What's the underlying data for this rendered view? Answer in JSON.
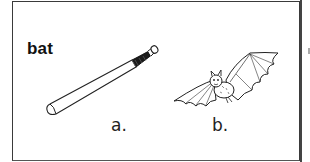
{
  "card": {
    "word": "bat",
    "choices": [
      {
        "label": "a.",
        "icon": "baseball-bat-icon",
        "description": "baseball bat"
      },
      {
        "label": "b.",
        "icon": "bat-animal-icon",
        "description": "flying bat (animal)"
      }
    ]
  },
  "colors": {
    "border": "#3a3a3a",
    "ink": "#111111",
    "background": "#ffffff"
  }
}
